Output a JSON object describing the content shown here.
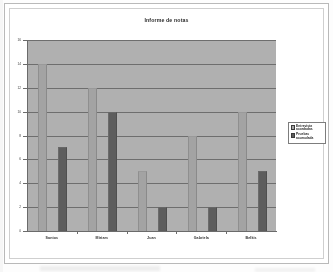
{
  "document": {
    "type": "scanned-chart-page",
    "frame_style": "double-border"
  },
  "chart_data": {
    "type": "bar",
    "title": "Informe de notas",
    "xlabel": "",
    "ylabel": "",
    "categories": [
      "Santos",
      "Miriam",
      "Juan",
      "Gabriela",
      "Belkis"
    ],
    "series": [
      {
        "name": "Entrevista acordadas",
        "values": [
          14,
          12,
          5,
          8,
          10
        ]
      },
      {
        "name": "Pruebas acumulada",
        "values": [
          7,
          10,
          2,
          2,
          5
        ]
      }
    ],
    "ylim": [
      0,
      16
    ],
    "yticks": [
      0,
      2,
      4,
      6,
      8,
      10,
      12,
      14,
      16
    ],
    "ytick_labels": [
      "0",
      "2",
      "4",
      "6",
      "8",
      "10",
      "12",
      "14",
      "16"
    ],
    "grid": true,
    "grid_axis": "y",
    "legend_position": "right",
    "plot_background": "#b0b0b0",
    "series_colors": [
      "#a3a3a3",
      "#5d5d5d"
    ]
  },
  "legend": {
    "entries": [
      {
        "label": "Entrevista acordadas",
        "color": "#a3a3a3"
      },
      {
        "label": "Pruebas acumulada",
        "color": "#5d5d5d"
      }
    ]
  }
}
